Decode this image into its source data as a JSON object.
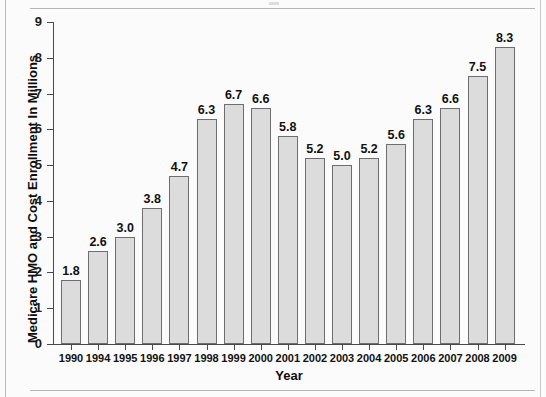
{
  "chart_data": {
    "type": "bar",
    "title": "",
    "xlabel": "Year",
    "ylabel": "Medicare HMO and Cost Enrollment In Millions",
    "categories": [
      "1990",
      "1994",
      "1995",
      "1996",
      "1997",
      "1998",
      "1999",
      "2000",
      "2001",
      "2002",
      "2003",
      "2004",
      "2005",
      "2006",
      "2007",
      "2008",
      "2009"
    ],
    "values": [
      1.8,
      2.6,
      3.0,
      3.8,
      4.7,
      6.3,
      6.7,
      6.6,
      5.8,
      5.2,
      5.0,
      5.2,
      5.6,
      6.3,
      6.6,
      7.5,
      8.3
    ],
    "data_labels": [
      "1.8",
      "2.6",
      "3.0",
      "3.8",
      "4.7",
      "6.3",
      "6.7",
      "6.6",
      "5.8",
      "5.2",
      "5.0",
      "5.2",
      "5.6",
      "6.3",
      "6.6",
      "7.5",
      "8.3"
    ],
    "ylim": [
      0,
      9
    ],
    "yticks": [
      0,
      1,
      2,
      3,
      4,
      5,
      6,
      7,
      8,
      9
    ],
    "ytick_labels": [
      "0",
      "1",
      "2",
      "3",
      "4",
      "5",
      "6",
      "7",
      "8",
      "9"
    ],
    "grid": false,
    "legend": "none",
    "bar_color": "#dcdcdc",
    "bar_edge_color": "#6e6e6e",
    "axis_color": "#4a4a4a",
    "text_color": "#111111",
    "background": "#fbfbfb"
  }
}
